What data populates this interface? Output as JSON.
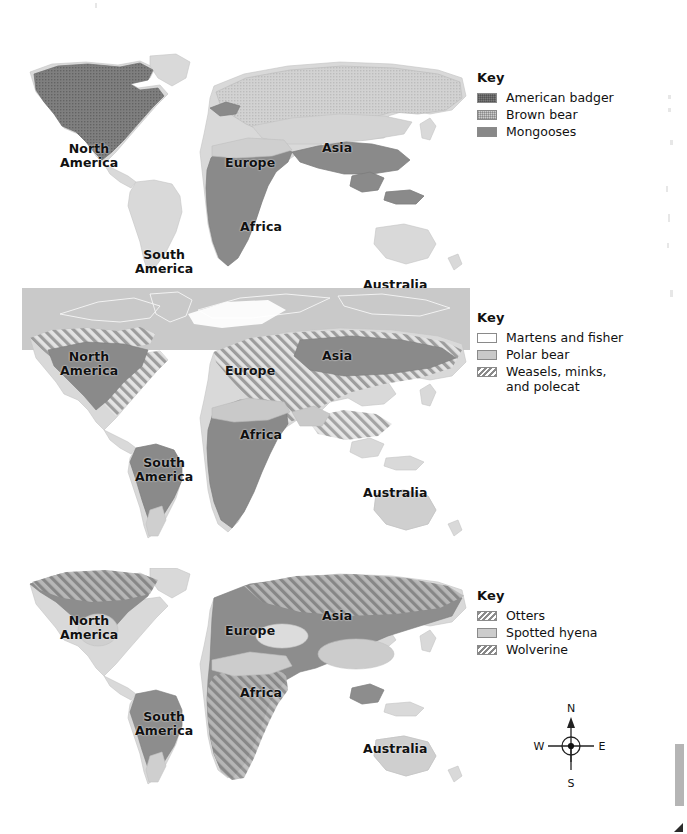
{
  "document": {
    "kind": "world-distribution-map-figure",
    "map_count": 3
  },
  "maps": [
    {
      "id": "map-1",
      "continent_labels": [
        {
          "text": "North\nAmerica",
          "x": 60,
          "y": 90
        },
        {
          "text": "South\nAmerica",
          "x": 135,
          "y": 196
        },
        {
          "text": "Europe",
          "x": 225,
          "y": 104
        },
        {
          "text": "Asia",
          "x": 322,
          "y": 89
        },
        {
          "text": "Africa",
          "x": 240,
          "y": 168
        },
        {
          "text": "Australia",
          "x": 363,
          "y": 226
        }
      ],
      "key": {
        "title": "Key",
        "entries": [
          {
            "label": "American badger",
            "color": "#7b7b7b",
            "pattern": "stipple"
          },
          {
            "label": "Brown bear",
            "color": "#cdcdcd",
            "pattern": "stipple"
          },
          {
            "label": "Mongooses",
            "color": "#888888",
            "pattern": "solid"
          }
        ]
      }
    },
    {
      "id": "map-2",
      "continent_labels": [
        {
          "text": "North\nAmerica",
          "x": 60,
          "y": 62
        },
        {
          "text": "South\nAmerica",
          "x": 135,
          "y": 168
        },
        {
          "text": "Europe",
          "x": 225,
          "y": 76
        },
        {
          "text": "Asia",
          "x": 322,
          "y": 61
        },
        {
          "text": "Africa",
          "x": 240,
          "y": 140
        },
        {
          "text": "Australia",
          "x": 363,
          "y": 198
        }
      ],
      "key": {
        "title": "Key",
        "entries": [
          {
            "label": "Martens and fisher",
            "color": "#ffffff",
            "pattern": "solid"
          },
          {
            "label": "Polar bear",
            "color": "#c9c9c9",
            "pattern": "solid"
          },
          {
            "label": "Weasels, minks,\nand polecat",
            "color": "#8a8a8a",
            "pattern": "hatch"
          }
        ]
      }
    },
    {
      "id": "map-3",
      "continent_labels": [
        {
          "text": "North\nAmerica",
          "x": 60,
          "y": 46
        },
        {
          "text": "South\nAmerica",
          "x": 135,
          "y": 142
        },
        {
          "text": "Europe",
          "x": 225,
          "y": 56
        },
        {
          "text": "Asia",
          "x": 322,
          "y": 41
        },
        {
          "text": "Africa",
          "x": 240,
          "y": 118
        },
        {
          "text": "Australia",
          "x": 363,
          "y": 174
        }
      ],
      "key": {
        "title": "Key",
        "entries": [
          {
            "label": "Otters",
            "color": "#8d8d8d",
            "pattern": "hatch"
          },
          {
            "label": "Spotted hyena",
            "color": "#cccccc",
            "pattern": "solid"
          },
          {
            "label": "Wolverine",
            "color": "#878787",
            "pattern": "hatch"
          }
        ]
      }
    }
  ],
  "compass": {
    "north": "N",
    "east": "E",
    "south": "S",
    "west": "W"
  },
  "colors": {
    "land_base": "#d8d8d8",
    "land_outline": "#bdbdbd",
    "dark_range": "#7b7b7b",
    "mid_range": "#8d8d8d",
    "light_range": "#c9c9c9",
    "text": "#111111",
    "background": "#ffffff"
  }
}
